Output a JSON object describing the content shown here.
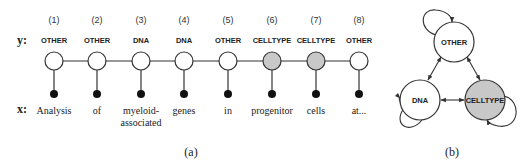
{
  "panel_a": {
    "caption": "(a)",
    "y_label": "y:",
    "x_label": "x:",
    "positions": [
      {
        "index": "(1)",
        "tag": "OTHER",
        "word": "Analysis",
        "word2": "",
        "shaded": false
      },
      {
        "index": "(2)",
        "tag": "OTHER",
        "word": "of",
        "word2": "",
        "shaded": false
      },
      {
        "index": "(3)",
        "tag": "DNA",
        "word": "myeloid-",
        "word2": "associated",
        "shaded": false
      },
      {
        "index": "(4)",
        "tag": "DNA",
        "word": "genes",
        "word2": "",
        "shaded": false
      },
      {
        "index": "(5)",
        "tag": "OTHER",
        "word": "in",
        "word2": "",
        "shaded": false
      },
      {
        "index": "(6)",
        "tag": "CELLTYPE",
        "word": "progenitor",
        "word2": "",
        "shaded": true
      },
      {
        "index": "(7)",
        "tag": "CELLTYPE",
        "word": "cells",
        "word2": "",
        "shaded": true
      },
      {
        "index": "(8)",
        "tag": "OTHER",
        "word": "at...",
        "word2": "",
        "shaded": false
      }
    ]
  },
  "panel_b": {
    "caption": "(b)",
    "nodes": [
      {
        "label": "OTHER",
        "shaded": false
      },
      {
        "label": "DNA",
        "shaded": false
      },
      {
        "label": "CELLTYPE",
        "shaded": true
      }
    ]
  },
  "colors": {
    "shaded_fill": "#c8c8c8",
    "stroke": "#333333",
    "observed_fill": "#111111"
  }
}
